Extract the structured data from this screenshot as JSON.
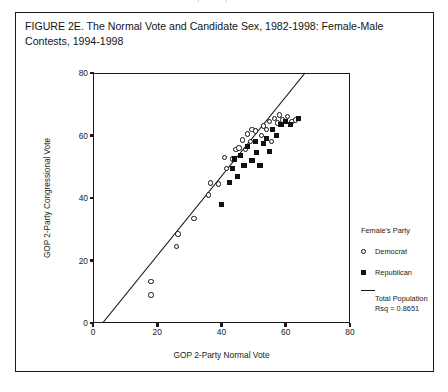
{
  "page": {
    "top_cut_text": "··· ········· ···········, ·······, ··· ······"
  },
  "caption": {
    "text": "FIGURE 2E. The Normal Vote and Candidate Sex, 1982-1998: Female-Male Contests, 1994-1998"
  },
  "legend": {
    "title": "Female's Party",
    "items": [
      {
        "label": "Democrat",
        "marker": "open-circle",
        "color": "#111111"
      },
      {
        "label": "Republican",
        "marker": "filled-square",
        "color": "#111111"
      }
    ],
    "fit": {
      "marker": "line",
      "label_line_1": "Total Population",
      "label_line_2": "Rsq = 0.8651",
      "color": "#111111"
    }
  },
  "chart_data": {
    "type": "scatter",
    "title": "FIGURE 2E. The Normal Vote and Candidate Sex, 1982-1998: Female-Male Contests, 1994-1998",
    "xlabel": "GOP 2-Party Normal Vote",
    "ylabel": "GOP 2-Party Congressional Vote",
    "xlim": [
      0,
      80
    ],
    "ylim": [
      0,
      80
    ],
    "xticks": [
      0,
      20,
      40,
      60,
      80
    ],
    "yticks": [
      0,
      20,
      40,
      60,
      80
    ],
    "grid": false,
    "legend_position": "right-outside",
    "annotations": [
      "Total Population",
      "Rsq = 0.8651"
    ],
    "fit_line": {
      "name": "Total Population",
      "rsq": 0.8651,
      "x": [
        3.0,
        66.0
      ],
      "y": [
        0.0,
        80.0
      ]
    },
    "series": [
      {
        "name": "Democrat",
        "marker": "open-circle",
        "color": "#111111",
        "points": [
          [
            18.0,
            13.2
          ],
          [
            18.0,
            9.0
          ],
          [
            26.0,
            24.5
          ],
          [
            26.5,
            28.5
          ],
          [
            31.5,
            33.5
          ],
          [
            36.0,
            41.0
          ],
          [
            36.5,
            44.8
          ],
          [
            39.0,
            44.5
          ],
          [
            41.5,
            49.5
          ],
          [
            41.0,
            53.0
          ],
          [
            43.5,
            52.5
          ],
          [
            44.5,
            55.5
          ],
          [
            45.5,
            56.0
          ],
          [
            46.5,
            58.5
          ],
          [
            47.5,
            55.5
          ],
          [
            48.0,
            60.5
          ],
          [
            49.0,
            58.0
          ],
          [
            49.5,
            62.0
          ],
          [
            50.5,
            61.5
          ],
          [
            52.5,
            60.0
          ],
          [
            53.0,
            63.0
          ],
          [
            54.0,
            62.0
          ],
          [
            55.0,
            64.5
          ],
          [
            55.5,
            58.0
          ],
          [
            56.5,
            65.5
          ],
          [
            57.5,
            64.0
          ],
          [
            58.0,
            66.5
          ],
          [
            59.0,
            65.0
          ],
          [
            60.5,
            66.0
          ],
          [
            62.0,
            64.5
          ],
          [
            63.0,
            65.0
          ]
        ]
      },
      {
        "name": "Republican",
        "marker": "filled-square",
        "color": "#111111",
        "points": [
          [
            40.0,
            38.0
          ],
          [
            42.5,
            45.0
          ],
          [
            43.5,
            49.5
          ],
          [
            44.0,
            52.5
          ],
          [
            45.0,
            47.0
          ],
          [
            46.0,
            53.5
          ],
          [
            47.0,
            50.5
          ],
          [
            48.0,
            56.5
          ],
          [
            49.5,
            52.0
          ],
          [
            50.5,
            58.0
          ],
          [
            51.0,
            54.5
          ],
          [
            52.0,
            50.5
          ],
          [
            53.0,
            57.5
          ],
          [
            54.0,
            59.0
          ],
          [
            55.0,
            55.0
          ],
          [
            56.0,
            62.0
          ],
          [
            57.0,
            60.0
          ],
          [
            58.5,
            63.5
          ],
          [
            60.0,
            64.5
          ],
          [
            61.5,
            63.5
          ],
          [
            64.0,
            65.5
          ]
        ]
      }
    ]
  }
}
